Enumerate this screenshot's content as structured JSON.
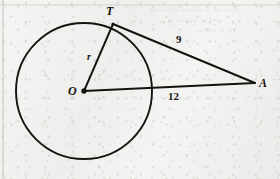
{
  "figure": {
    "background_color": "#f1f1ef",
    "ink_color": "#15130f",
    "circle": {
      "center_label": "O",
      "center_x": 84,
      "center_y": 91,
      "radius": 68
    },
    "points": [
      {
        "id": "T",
        "label": "T",
        "x": 113,
        "y": 24,
        "label_x": 106,
        "label_y": 6
      },
      {
        "id": "O",
        "label": "O",
        "x": 84,
        "y": 91,
        "label_x": 68,
        "label_y": 85
      },
      {
        "id": "A",
        "label": "A",
        "x": 255,
        "y": 83,
        "label_x": 259,
        "label_y": 77
      }
    ],
    "segments": [
      {
        "id": "radius-OT",
        "from": "O",
        "to": "T",
        "label": "r",
        "label_x": 87,
        "label_y": 52
      },
      {
        "id": "tangent-TA",
        "from": "T",
        "to": "A",
        "label": "9",
        "label_x": 176,
        "label_y": 34
      },
      {
        "id": "hypotenuse-OA",
        "from": "O",
        "to": "A",
        "label": "12",
        "label_x": 168,
        "label_y": 91
      }
    ],
    "measurements": {
      "radius_label": "r",
      "tangent_length": "9",
      "distance_center_to_point": "12"
    }
  },
  "paper": {
    "margin_rule_x": 3,
    "top_rule_y": 5,
    "ghost_lines": [
      {
        "text": "the circle shown at the right",
        "x": 150,
        "y": 10
      },
      {
        "text": "is tangent to line",
        "x": 168,
        "y": 20
      },
      {
        "text": "radius of the",
        "x": 196,
        "y": 30
      }
    ]
  }
}
